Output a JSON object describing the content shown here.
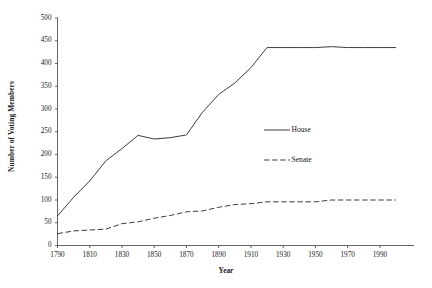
{
  "chart_data": {
    "type": "line",
    "title": "",
    "xlabel": "Year",
    "ylabel": "Number of Voting Members",
    "xlim": [
      1790,
      2000
    ],
    "ylim": [
      0,
      500
    ],
    "grid": false,
    "legend_position": "center-right-inside",
    "x": [
      1790,
      1800,
      1810,
      1820,
      1830,
      1840,
      1850,
      1860,
      1870,
      1880,
      1890,
      1900,
      1910,
      1920,
      1930,
      1940,
      1950,
      1960,
      1970,
      1980,
      1990,
      2000
    ],
    "xticks": [
      "1790",
      "1810",
      "1830",
      "1850",
      "1870",
      "1890",
      "1910",
      "1930",
      "1950",
      "1970",
      "1990"
    ],
    "xtick_values": [
      1790,
      1810,
      1830,
      1850,
      1870,
      1890,
      1910,
      1930,
      1950,
      1970,
      1990
    ],
    "yticks": [
      "0",
      "50",
      "100",
      "150",
      "200",
      "250",
      "300",
      "350",
      "400",
      "450",
      "500"
    ],
    "ytick_values": [
      0,
      50,
      100,
      150,
      200,
      250,
      300,
      350,
      400,
      450,
      500
    ],
    "series": [
      {
        "name": "House",
        "style": "solid",
        "color": "#3d3d3d",
        "values": [
          65,
          106,
          142,
          186,
          213,
          242,
          234,
          237,
          243,
          293,
          332,
          357,
          391,
          435,
          435,
          435,
          435,
          437,
          435,
          435,
          435,
          435
        ]
      },
      {
        "name": "Senate",
        "style": "dashed",
        "color": "#3d3d3d",
        "values": [
          26,
          32,
          34,
          36,
          48,
          52,
          60,
          66,
          74,
          76,
          84,
          90,
          92,
          96,
          96,
          96,
          96,
          100,
          100,
          100,
          100,
          100
        ]
      }
    ]
  },
  "legend": {
    "items": [
      {
        "label": "House",
        "style": "solid"
      },
      {
        "label": "Senate",
        "style": "dashed"
      }
    ]
  },
  "axis": {
    "line_color": "#555555"
  }
}
